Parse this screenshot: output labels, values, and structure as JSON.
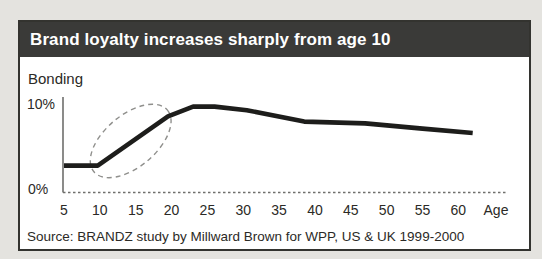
{
  "chart_data": {
    "type": "line",
    "title": "Brand loyalty increases sharply from age 10",
    "ylabel": "Bonding",
    "xlabel": "Age",
    "x_ticks": [
      5,
      10,
      15,
      20,
      25,
      30,
      35,
      40,
      45,
      50,
      55,
      60
    ],
    "y_tick_labels": [
      "0%",
      "10%"
    ],
    "xlim": [
      4.8,
      67
    ],
    "ylim": [
      0,
      10.8
    ],
    "grid": false,
    "legend": false,
    "series": [
      {
        "name": "Bonding by age",
        "points": [
          [
            5,
            3.0
          ],
          [
            9.7,
            3.0
          ],
          [
            19.5,
            8.6
          ],
          [
            23,
            9.7
          ],
          [
            26,
            9.7
          ],
          [
            30.5,
            9.3
          ],
          [
            38.5,
            8.0
          ],
          [
            47,
            7.8
          ],
          [
            55,
            7.2
          ],
          [
            62,
            6.7
          ]
        ]
      }
    ],
    "annotations": [
      {
        "type": "ellipse-highlight",
        "style": "dashed",
        "meaning": "highlights sharp rise in bonding between ages 10 and 20",
        "center_age": 14.3,
        "center_value": 5.8,
        "radius_x_px": 48,
        "radius_y_px": 26,
        "angle_deg": -40
      }
    ]
  },
  "source": "Source: BRANDZ study by Millward Brown for WPP, US & UK 1999-2000",
  "colors": {
    "page_background": "#e4e3df",
    "titlebar_background": "#3a3a38",
    "titlebar_text": "#ffffff",
    "chart_background": "#ffffff",
    "figure_border": "#33332f",
    "data_line": "#1d1d1b",
    "axis": "#6f6f6c",
    "annotation": "#8f8f8c",
    "label_text": "#2b2a26"
  }
}
